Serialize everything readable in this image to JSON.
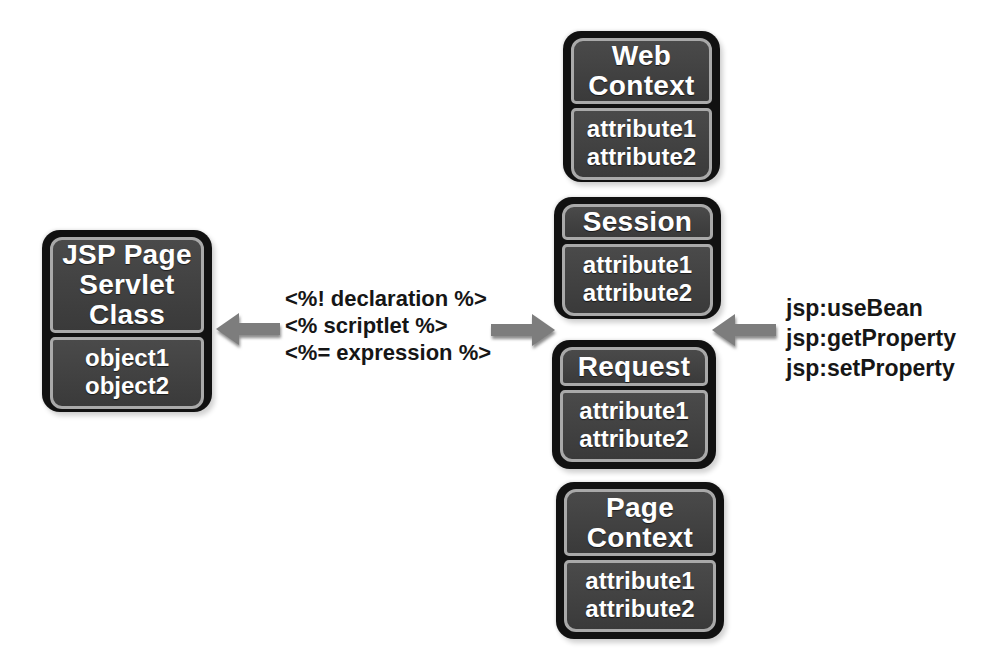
{
  "boxes": {
    "jsp_page": {
      "title_lines": [
        "JSP Page",
        "Servlet",
        "Class"
      ],
      "attributes": [
        "object1",
        "object2"
      ]
    },
    "web_context": {
      "title_lines": [
        "Web",
        "Context"
      ],
      "attributes": [
        "attribute1",
        "attribute2"
      ]
    },
    "session": {
      "title_lines": [
        "Session"
      ],
      "attributes": [
        "attribute1",
        "attribute2"
      ]
    },
    "request": {
      "title_lines": [
        "Request"
      ],
      "attributes": [
        "attribute1",
        "attribute2"
      ]
    },
    "page_context": {
      "title_lines": [
        "Page",
        "Context"
      ],
      "attributes": [
        "attribute1",
        "attribute2"
      ]
    }
  },
  "labels": {
    "scripting": [
      "<%! declaration %>",
      "<% scriptlet %>",
      "<%= expression %>"
    ],
    "actions": [
      "jsp:useBean",
      "jsp:getProperty",
      "jsp:setProperty"
    ]
  },
  "icons": {
    "left_arrow": "arrow-left-icon",
    "right_arrow": "arrow-right-icon"
  },
  "colors": {
    "background": "#ffffff",
    "box_rim": "#111111",
    "box_fill": "#3f3f3f",
    "box_outline": "#a9a9a9",
    "box_text": "#ffffff",
    "label_text": "#161616",
    "arrow_fill": "#7d7d7d"
  }
}
